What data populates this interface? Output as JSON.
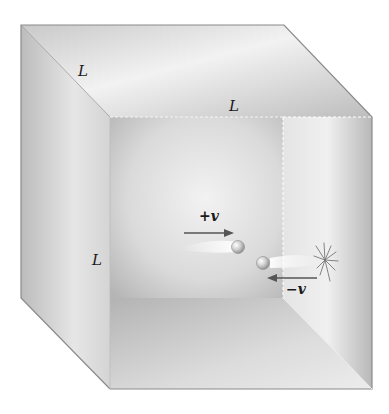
{
  "figure": {
    "edge_labels": [
      {
        "id": "depth",
        "text": "L"
      },
      {
        "id": "width",
        "text": "L"
      },
      {
        "id": "height",
        "text": "L"
      }
    ],
    "velocity_labels": {
      "positive": "+v",
      "negative": "−v"
    },
    "colors": {
      "box_light": "#eeeeee",
      "box_mid": "#d0d0d0",
      "box_dark": "#a9a9a9",
      "edge": "#8a8a8a",
      "arrow": "#555555",
      "text": "#1a1a1a"
    }
  }
}
